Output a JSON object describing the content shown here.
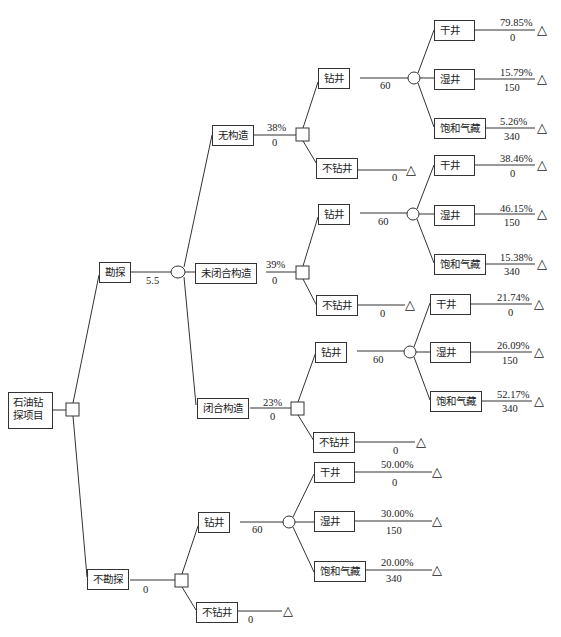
{
  "diagram": {
    "type": "decision-tree",
    "root": {
      "label": "石油钻探项目",
      "label_line1": "石油钻",
      "label_line2": "探项目"
    },
    "branches": [
      {
        "label": "勘探",
        "value": "5.5",
        "outcomes": [
          {
            "label": "无构造",
            "probability": "38%",
            "value": "0",
            "decisions": [
              {
                "label": "钻井",
                "value": "60",
                "results": [
                  {
                    "label": "干井",
                    "probability": "79.85%",
                    "value": "0"
                  },
                  {
                    "label": "湿井",
                    "probability": "15.79%",
                    "value": "150"
                  },
                  {
                    "label": "饱和气藏",
                    "probability": "5.26%",
                    "value": "340"
                  }
                ]
              },
              {
                "label": "不钻井",
                "value": "0"
              }
            ]
          },
          {
            "label": "未闭合构造",
            "probability": "39%",
            "value": "0",
            "decisions": [
              {
                "label": "钻井",
                "value": "60",
                "results": [
                  {
                    "label": "干井",
                    "probability": "38.46%",
                    "value": "0"
                  },
                  {
                    "label": "湿井",
                    "probability": "46.15%",
                    "value": "150"
                  },
                  {
                    "label": "饱和气藏",
                    "probability": "15.38%",
                    "value": "340"
                  }
                ]
              },
              {
                "label": "不钻井",
                "value": "0"
              }
            ]
          },
          {
            "label": "闭合构造",
            "probability": "23%",
            "value": "0",
            "decisions": [
              {
                "label": "钻井",
                "value": "60",
                "results": [
                  {
                    "label": "干井",
                    "probability": "21.74%",
                    "value": "0"
                  },
                  {
                    "label": "湿井",
                    "probability": "26.09%",
                    "value": "150"
                  },
                  {
                    "label": "饱和气藏",
                    "probability": "52.17%",
                    "value": "340"
                  }
                ]
              },
              {
                "label": "不钻井",
                "value": "0"
              }
            ]
          }
        ]
      },
      {
        "label": "不勘探",
        "value": "0",
        "decisions": [
          {
            "label": "钻井",
            "value": "60",
            "results": [
              {
                "label": "干井",
                "probability": "50.00%",
                "value": "0"
              },
              {
                "label": "湿井",
                "probability": "30.00%",
                "value": "150"
              },
              {
                "label": "饱和气藏",
                "probability": "20.00%",
                "value": "340"
              }
            ]
          },
          {
            "label": "不钻井",
            "value": "0"
          }
        ]
      }
    ],
    "terminal_symbol": "△"
  }
}
